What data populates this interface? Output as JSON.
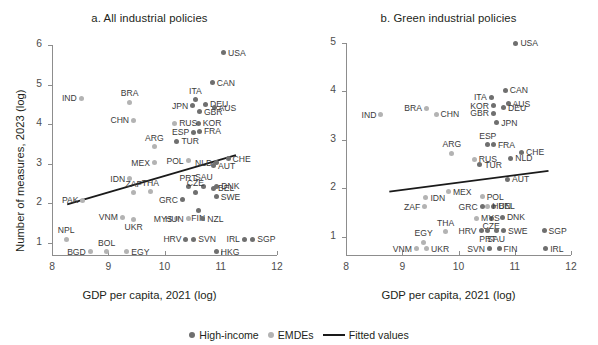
{
  "figure": {
    "legend": {
      "high_income_label": "High-income",
      "emdes_label": "EMDEs",
      "fitted_label": "Fitted values"
    },
    "colors": {
      "high_income": "#6f6f6f",
      "emdes": "#b3b3b3",
      "fitted_line": "#1a1a1a",
      "axis": "#8d8d8d"
    }
  },
  "chart_data": [
    {
      "type": "scatter",
      "id": "panel-a",
      "title": "a. All industrial policies",
      "xlabel": "GDP per capita, 2021 (log)",
      "ylabel": "Number of measures, 2023 (log)",
      "xlim": [
        8,
        12
      ],
      "ylim": [
        0.7,
        6
      ],
      "xticks": [
        8,
        9,
        10,
        11,
        12
      ],
      "yticks": [
        1,
        2,
        3,
        4,
        5,
        6
      ],
      "grid": false,
      "legend_position": "bottom-center",
      "series": [
        {
          "name": "High-income",
          "group": "hi",
          "points": [
            {
              "label": "USA",
              "x": 11.05,
              "y": 5.8,
              "pos": "r"
            },
            {
              "label": "CAN",
              "x": 10.85,
              "y": 5.05,
              "pos": "r"
            },
            {
              "label": "ITA",
              "x": 10.55,
              "y": 4.62,
              "pos": "t"
            },
            {
              "label": "JPN",
              "x": 10.5,
              "y": 4.47,
              "pos": "l"
            },
            {
              "label": "DEU",
              "x": 10.73,
              "y": 4.5,
              "pos": "r"
            },
            {
              "label": "AUS",
              "x": 10.88,
              "y": 4.42,
              "pos": "r"
            },
            {
              "label": "GBR",
              "x": 10.62,
              "y": 4.31,
              "pos": "r"
            },
            {
              "label": "KOR",
              "x": 10.6,
              "y": 4.02,
              "pos": "r"
            },
            {
              "label": "FRA",
              "x": 10.62,
              "y": 3.82,
              "pos": "r"
            },
            {
              "label": "ESP",
              "x": 10.52,
              "y": 3.8,
              "pos": "l"
            },
            {
              "label": "TUR",
              "x": 10.22,
              "y": 3.57,
              "pos": "r"
            },
            {
              "label": "NLD",
              "x": 10.93,
              "y": 3.03,
              "pos": "l"
            },
            {
              "label": "CHE",
              "x": 11.13,
              "y": 3.13,
              "pos": "r"
            },
            {
              "label": "AUT",
              "x": 10.87,
              "y": 2.95,
              "pos": "r"
            },
            {
              "label": "PRT",
              "x": 10.42,
              "y": 2.42,
              "pos": "t"
            },
            {
              "label": "SAU",
              "x": 10.7,
              "y": 2.44,
              "pos": "t"
            },
            {
              "label": "DNK",
              "x": 10.93,
              "y": 2.44,
              "pos": "r"
            },
            {
              "label": "BEL",
              "x": 10.87,
              "y": 2.38,
              "pos": "r"
            },
            {
              "label": "CZE",
              "x": 10.55,
              "y": 2.28,
              "pos": "t"
            },
            {
              "label": "SWE",
              "x": 10.92,
              "y": 2.17,
              "pos": "r"
            },
            {
              "label": "GRC",
              "x": 10.32,
              "y": 2.1,
              "pos": "l"
            },
            {
              "label": "FIN",
              "x": 10.6,
              "y": 1.83,
              "pos": "b"
            },
            {
              "label": "NZL",
              "x": 10.68,
              "y": 1.62,
              "pos": "r"
            },
            {
              "label": "HRV",
              "x": 10.38,
              "y": 1.1,
              "pos": "l"
            },
            {
              "label": "SVN",
              "x": 10.52,
              "y": 1.1,
              "pos": "r"
            },
            {
              "label": "IRL",
              "x": 11.42,
              "y": 1.1,
              "pos": "l"
            },
            {
              "label": "SGP",
              "x": 11.57,
              "y": 1.1,
              "pos": "r"
            },
            {
              "label": "HKG",
              "x": 10.92,
              "y": 0.78,
              "pos": "r"
            }
          ]
        },
        {
          "name": "EMDEs",
          "group": "em",
          "points": [
            {
              "label": "IND",
              "x": 8.52,
              "y": 4.65,
              "pos": "l"
            },
            {
              "label": "BRA",
              "x": 9.38,
              "y": 4.55,
              "pos": "t"
            },
            {
              "label": "CHN",
              "x": 9.45,
              "y": 4.1,
              "pos": "l"
            },
            {
              "label": "RUS",
              "x": 10.18,
              "y": 4.03,
              "pos": "r"
            },
            {
              "label": "ARG",
              "x": 9.82,
              "y": 3.43,
              "pos": "t"
            },
            {
              "label": "MEX",
              "x": 9.82,
              "y": 3.03,
              "pos": "l"
            },
            {
              "label": "POL",
              "x": 10.42,
              "y": 3.08,
              "pos": "l"
            },
            {
              "label": "IDN",
              "x": 9.38,
              "y": 2.63,
              "pos": "l"
            },
            {
              "label": "PAK",
              "x": 8.55,
              "y": 2.08,
              "pos": "l"
            },
            {
              "label": "ZAF",
              "x": 9.45,
              "y": 2.27,
              "pos": "t"
            },
            {
              "label": "THA",
              "x": 9.75,
              "y": 2.3,
              "pos": "t"
            },
            {
              "label": "MYS",
              "x": 10.22,
              "y": 1.62,
              "pos": "l"
            },
            {
              "label": "HUN",
              "x": 10.42,
              "y": 1.62,
              "pos": "l"
            },
            {
              "label": "VNM",
              "x": 9.25,
              "y": 1.65,
              "pos": "l"
            },
            {
              "label": "UKR",
              "x": 9.45,
              "y": 1.6,
              "pos": "b"
            },
            {
              "label": "NPL",
              "x": 8.25,
              "y": 1.1,
              "pos": "t"
            },
            {
              "label": "BOL",
              "x": 8.97,
              "y": 0.78,
              "pos": "t"
            },
            {
              "label": "BGD",
              "x": 8.68,
              "y": 0.78,
              "pos": "l"
            },
            {
              "label": "EGY",
              "x": 9.33,
              "y": 0.78,
              "pos": "r"
            }
          ]
        }
      ],
      "fitted_values": {
        "x0": 8.27,
        "y0": 1.98,
        "x1": 11.27,
        "y1": 3.22
      }
    },
    {
      "type": "scatter",
      "id": "panel-b",
      "title": "b. Green industrial policies",
      "xlabel": "GDP per capita, 2021 (log)",
      "ylabel": "Number of measures, 2023 (log)",
      "xlim": [
        8,
        12
      ],
      "ylim": [
        0.62,
        5
      ],
      "xticks": [
        8,
        9,
        10,
        11,
        12
      ],
      "yticks": [
        1,
        2,
        3,
        4,
        5
      ],
      "grid": false,
      "legend_position": "bottom-center",
      "series": [
        {
          "name": "High-income",
          "group": "hi",
          "points": [
            {
              "label": "USA",
              "x": 11.02,
              "y": 5.0,
              "pos": "r"
            },
            {
              "label": "CAN",
              "x": 10.83,
              "y": 4.02,
              "pos": "r"
            },
            {
              "label": "ITA",
              "x": 10.58,
              "y": 3.88,
              "pos": "l"
            },
            {
              "label": "AUS",
              "x": 10.88,
              "y": 3.74,
              "pos": "r"
            },
            {
              "label": "KOR",
              "x": 10.62,
              "y": 3.7,
              "pos": "l"
            },
            {
              "label": "DEU",
              "x": 10.8,
              "y": 3.66,
              "pos": "r"
            },
            {
              "label": "GBR",
              "x": 10.62,
              "y": 3.55,
              "pos": "l"
            },
            {
              "label": "JPN",
              "x": 10.68,
              "y": 3.35,
              "pos": "r"
            },
            {
              "label": "ESP",
              "x": 10.52,
              "y": 2.9,
              "pos": "t"
            },
            {
              "label": "FRA",
              "x": 10.62,
              "y": 2.9,
              "pos": "r"
            },
            {
              "label": "CHE",
              "x": 11.12,
              "y": 2.74,
              "pos": "r"
            },
            {
              "label": "NLD",
              "x": 10.93,
              "y": 2.62,
              "pos": "r"
            },
            {
              "label": "TUR",
              "x": 10.38,
              "y": 2.48,
              "pos": "r"
            },
            {
              "label": "AUT",
              "x": 10.87,
              "y": 2.18,
              "pos": "r"
            },
            {
              "label": "BEL",
              "x": 10.63,
              "y": 1.63,
              "pos": "r"
            },
            {
              "label": "CZE",
              "x": 10.58,
              "y": 1.38,
              "pos": "b"
            },
            {
              "label": "DNK",
              "x": 10.78,
              "y": 1.4,
              "pos": "r"
            },
            {
              "label": "HRV",
              "x": 10.4,
              "y": 1.12,
              "pos": "l"
            },
            {
              "label": "SWE",
              "x": 10.8,
              "y": 1.12,
              "pos": "r"
            },
            {
              "label": "SGP",
              "x": 11.52,
              "y": 1.12,
              "pos": "r"
            },
            {
              "label": "PRT",
              "x": 10.52,
              "y": 1.12,
              "pos": "b"
            },
            {
              "label": "SAU",
              "x": 10.67,
              "y": 1.12,
              "pos": "b"
            },
            {
              "label": "SVN",
              "x": 10.55,
              "y": 0.75,
              "pos": "l"
            },
            {
              "label": "FIN",
              "x": 10.72,
              "y": 0.75,
              "pos": "r"
            },
            {
              "label": "IRL",
              "x": 11.55,
              "y": 0.75,
              "pos": "r"
            },
            {
              "label": "GRC",
              "x": 10.42,
              "y": 1.62,
              "pos": "l"
            }
          ]
        },
        {
          "name": "EMDEs",
          "group": "em",
          "points": [
            {
              "label": "IND",
              "x": 8.62,
              "y": 3.52,
              "pos": "l"
            },
            {
              "label": "BRA",
              "x": 9.43,
              "y": 3.65,
              "pos": "l"
            },
            {
              "label": "CHN",
              "x": 9.6,
              "y": 3.53,
              "pos": "r"
            },
            {
              "label": "ARG",
              "x": 9.88,
              "y": 2.72,
              "pos": "t"
            },
            {
              "label": "RUS",
              "x": 10.28,
              "y": 2.6,
              "pos": "r"
            },
            {
              "label": "MEX",
              "x": 9.82,
              "y": 1.93,
              "pos": "r"
            },
            {
              "label": "IDN",
              "x": 9.42,
              "y": 1.8,
              "pos": "r"
            },
            {
              "label": "POL",
              "x": 10.42,
              "y": 1.82,
              "pos": "r"
            },
            {
              "label": "ZAF",
              "x": 9.4,
              "y": 1.62,
              "pos": "l"
            },
            {
              "label": "HUN",
              "x": 10.52,
              "y": 1.63,
              "pos": "r"
            },
            {
              "label": "MYS",
              "x": 10.32,
              "y": 1.38,
              "pos": "r"
            },
            {
              "label": "THA",
              "x": 9.77,
              "y": 1.1,
              "pos": "t"
            },
            {
              "label": "EGY",
              "x": 9.38,
              "y": 0.88,
              "pos": "t"
            },
            {
              "label": "VNM",
              "x": 9.25,
              "y": 0.75,
              "pos": "l"
            },
            {
              "label": "UKR",
              "x": 9.43,
              "y": 0.75,
              "pos": "r"
            }
          ]
        }
      ],
      "fitted_values": {
        "x0": 8.77,
        "y0": 1.93,
        "x1": 11.6,
        "y1": 2.36
      }
    }
  ]
}
